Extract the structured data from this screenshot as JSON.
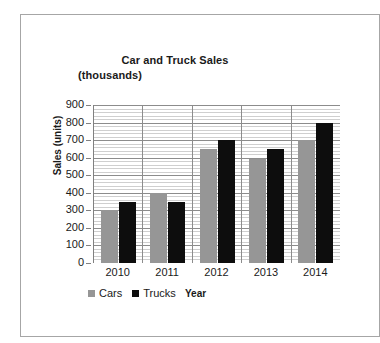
{
  "chart_data": {
    "type": "bar",
    "title": "Car and Truck Sales (thousands)",
    "title_line1": "Car and Truck Sales",
    "title_line2": "(thousands)",
    "xlabel": "Year",
    "ylabel": "Sales (units)",
    "categories": [
      "2010",
      "2011",
      "2012",
      "2013",
      "2014"
    ],
    "series": [
      {
        "name": "Cars",
        "color": "#969696",
        "values": [
          300,
          400,
          650,
          595,
          700
        ]
      },
      {
        "name": "Trucks",
        "color": "#0d0d0d",
        "values": [
          350,
          350,
          700,
          650,
          800
        ]
      }
    ],
    "ylim": [
      0,
      900
    ],
    "ytick_labels": [
      "900",
      "800",
      "700",
      "600",
      "500",
      "400",
      "300",
      "200",
      "100",
      "0"
    ],
    "ytick_values": [
      900,
      800,
      700,
      600,
      500,
      400,
      300,
      200,
      100,
      0
    ],
    "ytick_step": 100,
    "minor_gridline_step": 20,
    "grid": "horizontal-major-and-minor-plus-vertical-category",
    "legend_position": "bottom-left"
  },
  "frame": {
    "border_color": "#a6a6a6"
  }
}
